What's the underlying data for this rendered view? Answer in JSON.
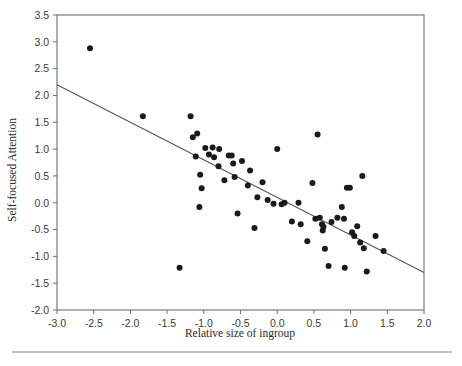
{
  "chart_data": {
    "type": "scatter",
    "title": "",
    "xlabel": "Relative size of ingroup",
    "ylabel": "Self-focused Attention",
    "xlim": [
      -3.0,
      2.0
    ],
    "ylim": [
      -2.0,
      3.5
    ],
    "xticks": [
      -3.0,
      -2.5,
      -2.0,
      -1.5,
      -1.0,
      -0.5,
      0.0,
      0.5,
      1.0,
      1.5,
      2.0
    ],
    "xticklabels": [
      "-3.0",
      "-2.5",
      "-2.0",
      "-1.5",
      "-1.0",
      "-0.5",
      "0.0",
      "0.5",
      "1.0",
      "1.5",
      "2.0"
    ],
    "yticks": [
      -2.0,
      -1.5,
      -1.0,
      -0.5,
      0.0,
      0.5,
      1.0,
      1.5,
      2.0,
      2.5,
      3.0,
      3.5
    ],
    "yticklabels": [
      "-2.0",
      "-1.5",
      "-1.0",
      "-0.5",
      "0.0",
      "0.5",
      "1.0",
      "1.5",
      "2.0",
      "2.5",
      "3.0",
      "3.5"
    ],
    "grid": false,
    "legend": null,
    "marker": "filled-circle",
    "marker_color": "#1a1a1a",
    "marker_size": 3.0,
    "trendline": {
      "type": "linear-regression",
      "color": "#555555",
      "x_start": -3.0,
      "y_start": 2.2,
      "x_end": 2.0,
      "y_end": -1.3,
      "slope": -0.7,
      "intercept": 0.1
    },
    "points": [
      {
        "x": -2.55,
        "y": 2.88
      },
      {
        "x": -1.83,
        "y": 1.61
      },
      {
        "x": -1.33,
        "y": -1.21
      },
      {
        "x": -1.18,
        "y": 1.61
      },
      {
        "x": -1.15,
        "y": 1.22
      },
      {
        "x": -1.09,
        "y": 1.29
      },
      {
        "x": -1.11,
        "y": 0.86
      },
      {
        "x": -1.05,
        "y": 0.52
      },
      {
        "x": -1.03,
        "y": 0.27
      },
      {
        "x": -1.06,
        "y": -0.08
      },
      {
        "x": -0.98,
        "y": 1.02
      },
      {
        "x": -0.93,
        "y": 0.9
      },
      {
        "x": -0.88,
        "y": 1.03
      },
      {
        "x": -0.86,
        "y": 0.85
      },
      {
        "x": -0.8,
        "y": 0.68
      },
      {
        "x": -0.79,
        "y": 1.0
      },
      {
        "x": -0.72,
        "y": 0.42
      },
      {
        "x": -0.66,
        "y": 0.88
      },
      {
        "x": -0.62,
        "y": 0.88
      },
      {
        "x": -0.6,
        "y": 0.73
      },
      {
        "x": -0.58,
        "y": 0.48
      },
      {
        "x": -0.54,
        "y": -0.2
      },
      {
        "x": -0.48,
        "y": 0.78
      },
      {
        "x": -0.4,
        "y": 0.32
      },
      {
        "x": -0.37,
        "y": 0.6
      },
      {
        "x": -0.31,
        "y": -0.47
      },
      {
        "x": -0.27,
        "y": 0.1
      },
      {
        "x": -0.2,
        "y": 0.38
      },
      {
        "x": -0.13,
        "y": 0.05
      },
      {
        "x": -0.05,
        "y": -0.02
      },
      {
        "x": 0.0,
        "y": 1.0
      },
      {
        "x": 0.06,
        "y": -0.03
      },
      {
        "x": 0.1,
        "y": 0.0
      },
      {
        "x": 0.2,
        "y": -0.35
      },
      {
        "x": 0.29,
        "y": 0.0
      },
      {
        "x": 0.32,
        "y": -0.4
      },
      {
        "x": 0.41,
        "y": -0.72
      },
      {
        "x": 0.48,
        "y": 0.37
      },
      {
        "x": 0.52,
        "y": -0.3
      },
      {
        "x": 0.55,
        "y": 1.27
      },
      {
        "x": 0.58,
        "y": -0.28
      },
      {
        "x": 0.61,
        "y": -0.4
      },
      {
        "x": 0.63,
        "y": -0.45
      },
      {
        "x": 0.62,
        "y": -0.52
      },
      {
        "x": 0.65,
        "y": -0.86
      },
      {
        "x": 0.7,
        "y": -1.18
      },
      {
        "x": 0.74,
        "y": -0.36
      },
      {
        "x": 0.82,
        "y": -0.28
      },
      {
        "x": 0.88,
        "y": -0.08
      },
      {
        "x": 0.91,
        "y": -0.3
      },
      {
        "x": 0.95,
        "y": 0.28
      },
      {
        "x": 0.99,
        "y": 0.28
      },
      {
        "x": 0.92,
        "y": -1.21
      },
      {
        "x": 1.02,
        "y": -0.55
      },
      {
        "x": 1.05,
        "y": -0.62
      },
      {
        "x": 1.09,
        "y": -0.44
      },
      {
        "x": 1.13,
        "y": -0.74
      },
      {
        "x": 1.16,
        "y": 0.5
      },
      {
        "x": 1.18,
        "y": -0.85
      },
      {
        "x": 1.22,
        "y": -1.28
      },
      {
        "x": 1.34,
        "y": -0.62
      },
      {
        "x": 1.45,
        "y": -0.9
      }
    ]
  }
}
